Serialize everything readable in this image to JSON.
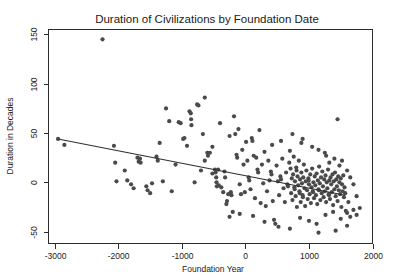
{
  "chart_data": {
    "type": "scatter",
    "title": "Duration of Civilizations by Foundation Date",
    "xlabel": "Foundation Year",
    "ylabel": "Duration in Decades",
    "xlim": [
      -3100,
      2000
    ],
    "ylim": [
      -62,
      155
    ],
    "xticks": [
      -3000,
      -2000,
      -1000,
      0,
      1000,
      2000
    ],
    "xtick_labels": [
      "-3000",
      "-2000",
      "-1000",
      "0",
      "1000",
      "2000"
    ],
    "yticks": [
      -50,
      0,
      50,
      100,
      150
    ],
    "ytick_labels": [
      "-50",
      "0",
      "50",
      "100",
      "150"
    ],
    "grid": false,
    "legend": null,
    "point_color": "#4a4a4a",
    "line_color": "#2f2f2f",
    "axis_color": "#2b2b2b",
    "background": "#ffffff",
    "marker_size": 4.2,
    "trend_line": {
      "label": "linear fit",
      "x": [
        -2950,
        1570
      ],
      "y": [
        44,
        -13
      ]
    },
    "points": [
      [
        -2950,
        44
      ],
      [
        -2850,
        38
      ],
      [
        -2250,
        145
      ],
      [
        -2070,
        37
      ],
      [
        -2050,
        20
      ],
      [
        -2030,
        1
      ],
      [
        -1860,
        2
      ],
      [
        -1800,
        -2
      ],
      [
        -1760,
        -6
      ],
      [
        -1700,
        25
      ],
      [
        -1680,
        21
      ],
      [
        -1660,
        24
      ],
      [
        -1650,
        20
      ],
      [
        -1560,
        -4
      ],
      [
        -1540,
        -8
      ],
      [
        -1500,
        -11
      ],
      [
        -1470,
        -1
      ],
      [
        -1400,
        26
      ],
      [
        -1380,
        22
      ],
      [
        -1300,
        1
      ],
      [
        -1250,
        75
      ],
      [
        -1200,
        62
      ],
      [
        -1160,
        -9
      ],
      [
        -1100,
        18
      ],
      [
        -1050,
        61
      ],
      [
        -1020,
        60
      ],
      [
        -980,
        44
      ],
      [
        -960,
        45
      ],
      [
        -920,
        37
      ],
      [
        -880,
        72
      ],
      [
        -860,
        70
      ],
      [
        -855,
        64
      ],
      [
        -850,
        58
      ],
      [
        -800,
        0
      ],
      [
        -760,
        79
      ],
      [
        -740,
        78
      ],
      [
        -700,
        12
      ],
      [
        -670,
        49
      ],
      [
        -640,
        86
      ],
      [
        -600,
        30
      ],
      [
        -590,
        27
      ],
      [
        -560,
        30
      ],
      [
        -520,
        9
      ],
      [
        -480,
        13
      ],
      [
        -470,
        10
      ],
      [
        -460,
        5
      ],
      [
        -455,
        0
      ],
      [
        -450,
        -4
      ],
      [
        -430,
        13
      ],
      [
        -420,
        -3
      ],
      [
        -400,
        60
      ],
      [
        -380,
        -5
      ],
      [
        -350,
        -10
      ],
      [
        -330,
        11
      ],
      [
        -320,
        5
      ],
      [
        -300,
        -22
      ],
      [
        -290,
        -19
      ],
      [
        -270,
        -12
      ],
      [
        -250,
        47
      ],
      [
        -230,
        -10
      ],
      [
        -220,
        -13
      ],
      [
        -200,
        -30
      ],
      [
        -180,
        67
      ],
      [
        -160,
        49
      ],
      [
        -140,
        28
      ],
      [
        -130,
        25
      ],
      [
        -110,
        54
      ],
      [
        -90,
        -2
      ],
      [
        -70,
        -12
      ],
      [
        -50,
        33
      ],
      [
        -30,
        18
      ],
      [
        -10,
        -10
      ],
      [
        10,
        41
      ],
      [
        30,
        22
      ],
      [
        50,
        5
      ],
      [
        60,
        2
      ],
      [
        80,
        -7
      ],
      [
        100,
        45
      ],
      [
        110,
        42
      ],
      [
        130,
        27
      ],
      [
        150,
        -16
      ],
      [
        170,
        25
      ],
      [
        190,
        13
      ],
      [
        200,
        10
      ],
      [
        220,
        53
      ],
      [
        240,
        -21
      ],
      [
        260,
        18
      ],
      [
        280,
        -1
      ],
      [
        300,
        31
      ],
      [
        320,
        -24
      ],
      [
        340,
        -9
      ],
      [
        360,
        22
      ],
      [
        380,
        2
      ],
      [
        400,
        11
      ],
      [
        410,
        8
      ],
      [
        430,
        -19
      ],
      [
        450,
        -38
      ],
      [
        470,
        -42
      ],
      [
        490,
        17
      ],
      [
        510,
        1
      ],
      [
        530,
        -13
      ],
      [
        550,
        6
      ],
      [
        560,
        3
      ],
      [
        580,
        24
      ],
      [
        600,
        -6
      ],
      [
        620,
        -20
      ],
      [
        640,
        10
      ],
      [
        660,
        -2
      ],
      [
        670,
        -4
      ],
      [
        690,
        20
      ],
      [
        700,
        32
      ],
      [
        710,
        14
      ],
      [
        720,
        -11
      ],
      [
        730,
        4
      ],
      [
        740,
        -18
      ],
      [
        750,
        8
      ],
      [
        760,
        26
      ],
      [
        770,
        -5
      ],
      [
        775,
        -7
      ],
      [
        780,
        1
      ],
      [
        790,
        -14
      ],
      [
        800,
        15
      ],
      [
        805,
        12
      ],
      [
        810,
        -25
      ],
      [
        820,
        6
      ],
      [
        830,
        -3
      ],
      [
        840,
        22
      ],
      [
        850,
        -9
      ],
      [
        855,
        -11
      ],
      [
        860,
        3
      ],
      [
        870,
        -20
      ],
      [
        880,
        10
      ],
      [
        890,
        -1
      ],
      [
        900,
        -13
      ],
      [
        905,
        -15
      ],
      [
        910,
        5
      ],
      [
        920,
        18
      ],
      [
        930,
        -6
      ],
      [
        940,
        -24
      ],
      [
        950,
        1
      ],
      [
        960,
        12
      ],
      [
        970,
        -8
      ],
      [
        980,
        -17
      ],
      [
        990,
        4
      ],
      [
        995,
        2
      ],
      [
        1000,
        -2
      ],
      [
        1010,
        -12
      ],
      [
        1020,
        8
      ],
      [
        1030,
        -21
      ],
      [
        1040,
        -5
      ],
      [
        1050,
        14
      ],
      [
        1060,
        -9
      ],
      [
        1065,
        -10
      ],
      [
        1070,
        0
      ],
      [
        1080,
        -16
      ],
      [
        1090,
        6
      ],
      [
        1100,
        -3
      ],
      [
        1110,
        -13
      ],
      [
        1120,
        9
      ],
      [
        1130,
        -22
      ],
      [
        1140,
        2
      ],
      [
        1150,
        -7
      ],
      [
        1155,
        -8
      ],
      [
        1160,
        16
      ],
      [
        1170,
        -1
      ],
      [
        1180,
        -18
      ],
      [
        1190,
        5
      ],
      [
        1200,
        -11
      ],
      [
        1210,
        11
      ],
      [
        1220,
        -4
      ],
      [
        1230,
        -15
      ],
      [
        1240,
        3
      ],
      [
        1250,
        -9
      ],
      [
        1260,
        7
      ],
      [
        1270,
        -20
      ],
      [
        1280,
        0
      ],
      [
        1290,
        -6
      ],
      [
        1300,
        13
      ],
      [
        1310,
        -12
      ],
      [
        1315,
        -13
      ],
      [
        1320,
        2
      ],
      [
        1330,
        -17
      ],
      [
        1340,
        5
      ],
      [
        1350,
        -2
      ],
      [
        1360,
        -10
      ],
      [
        1370,
        8
      ],
      [
        1380,
        -23
      ],
      [
        1390,
        1
      ],
      [
        1400,
        -7
      ],
      [
        1410,
        10
      ],
      [
        1420,
        -14
      ],
      [
        1430,
        3
      ],
      [
        1440,
        -4
      ],
      [
        1450,
        -19
      ],
      [
        1460,
        6
      ],
      [
        1470,
        -8
      ],
      [
        1480,
        0
      ],
      [
        1490,
        -12
      ],
      [
        1500,
        4
      ],
      [
        1510,
        -25
      ],
      [
        1520,
        -2
      ],
      [
        1530,
        -9
      ],
      [
        1540,
        7
      ],
      [
        1550,
        -15
      ],
      [
        1560,
        -5
      ],
      [
        1570,
        -11
      ],
      [
        1580,
        -29
      ],
      [
        1600,
        -31
      ],
      [
        1620,
        -20
      ],
      [
        1650,
        -35
      ],
      [
        1700,
        -28
      ],
      [
        1750,
        -33
      ],
      [
        1800,
        -26
      ],
      [
        1450,
        64
      ],
      [
        900,
        44
      ],
      [
        880,
        40
      ],
      [
        740,
        49
      ],
      [
        560,
        42
      ],
      [
        420,
        38
      ],
      [
        1250,
        30
      ],
      [
        1270,
        27
      ],
      [
        1150,
        33
      ],
      [
        1050,
        36
      ],
      [
        1320,
        20
      ],
      [
        1400,
        24
      ],
      [
        1480,
        17
      ],
      [
        1520,
        22
      ],
      [
        1600,
        12
      ],
      [
        1650,
        5
      ],
      [
        1700,
        -2
      ],
      [
        1750,
        -14
      ],
      [
        300,
        -40
      ],
      [
        520,
        -45
      ],
      [
        700,
        -47
      ],
      [
        860,
        -36
      ],
      [
        1000,
        -39
      ],
      [
        1120,
        -42
      ],
      [
        1260,
        -33
      ],
      [
        1380,
        -30
      ],
      [
        1500,
        -37
      ],
      [
        1150,
        -51
      ],
      [
        1420,
        -49
      ],
      [
        -250,
        -35
      ],
      [
        -90,
        -32
      ],
      [
        120,
        -34
      ],
      [
        -1900,
        12
      ],
      [
        -1350,
        40
      ],
      [
        -640,
        22
      ],
      [
        -520,
        36
      ],
      [
        1600,
        -44
      ],
      [
        1450,
        1450
      ]
    ]
  }
}
